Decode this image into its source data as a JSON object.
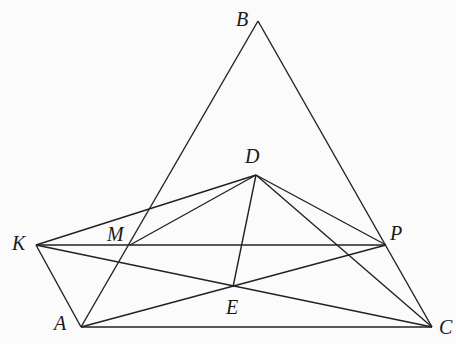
{
  "diagram": {
    "type": "geometry",
    "points": {
      "A": {
        "x": 81,
        "y": 327,
        "label": "A",
        "lx": 54,
        "ly": 330
      },
      "B": {
        "x": 258,
        "y": 21,
        "label": "B",
        "lx": 236,
        "ly": 26
      },
      "C": {
        "x": 432,
        "y": 327,
        "label": "C",
        "lx": 439,
        "ly": 334
      },
      "D": {
        "x": 256,
        "y": 175,
        "label": "D",
        "lx": 245,
        "ly": 163
      },
      "E": {
        "x": 233,
        "y": 287,
        "label": "E",
        "lx": 226,
        "ly": 314
      },
      "K": {
        "x": 36,
        "y": 245,
        "label": "K",
        "lx": 12,
        "ly": 250
      },
      "M": {
        "x": 130,
        "y": 245,
        "label": "M",
        "lx": 107,
        "ly": 241
      },
      "P": {
        "x": 386,
        "y": 245,
        "label": "P",
        "lx": 390,
        "ly": 240
      }
    },
    "segments": [
      [
        "A",
        "B"
      ],
      [
        "B",
        "C"
      ],
      [
        "A",
        "C"
      ],
      [
        "K",
        "A"
      ],
      [
        "K",
        "P"
      ],
      [
        "K",
        "D"
      ],
      [
        "K",
        "C"
      ],
      [
        "M",
        "D"
      ],
      [
        "D",
        "E"
      ],
      [
        "D",
        "P"
      ],
      [
        "D",
        "C"
      ],
      [
        "A",
        "P"
      ]
    ],
    "stroke_color": "#222222",
    "background": "#fbfbfb"
  }
}
